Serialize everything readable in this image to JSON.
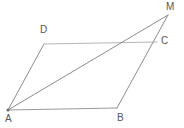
{
  "figure": {
    "type": "geometry-diagram",
    "canvas": {
      "width": 184,
      "height": 128,
      "background": "#ffffff"
    },
    "style": {
      "line_color": "#8c8c90",
      "line_color_light": "#b6b6b8",
      "line_width": 1,
      "label_color": "#57575a",
      "label_font_size": 10
    },
    "points": [
      {
        "id": "A",
        "label": "A",
        "x": 8,
        "y": 110,
        "label_x": 5,
        "label_y": 114
      },
      {
        "id": "B",
        "label": "B",
        "x": 117,
        "y": 108,
        "label_x": 117,
        "label_y": 113
      },
      {
        "id": "C",
        "label": "C",
        "x": 157,
        "y": 42,
        "label_x": 161,
        "label_y": 36
      },
      {
        "id": "D",
        "label": "D",
        "x": 44,
        "y": 44,
        "label_x": 40,
        "label_y": 25
      },
      {
        "id": "M",
        "label": "M",
        "x": 168,
        "y": 15,
        "label_x": 166,
        "label_y": 2
      }
    ],
    "segments": [
      {
        "id": "AD",
        "from": "A",
        "to": "D",
        "color": "#8c8c90"
      },
      {
        "id": "DC",
        "from": "D",
        "to": "C",
        "color": "#b6b6b8"
      },
      {
        "id": "AB",
        "from": "A",
        "to": "B",
        "color": "#9a9a9e"
      },
      {
        "id": "BM",
        "from": "B",
        "to": "M",
        "color": "#8c8c90"
      },
      {
        "id": "AM",
        "from": "A",
        "to": "M",
        "color": "#8c8c90"
      }
    ]
  }
}
